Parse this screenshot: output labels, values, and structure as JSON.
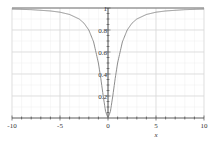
{
  "chart_data": {
    "type": "line",
    "title": "",
    "xlabel": "x",
    "ylabel": "",
    "xlim": [
      -10,
      10
    ],
    "ylim": [
      0,
      1
    ],
    "grid": true,
    "legend": null,
    "x_ticks": [
      -10,
      -5,
      0,
      5,
      10
    ],
    "x_tick_labels": [
      "-10",
      "-5",
      "0",
      "5",
      "10"
    ],
    "y_ticks": [
      0.2,
      0.4,
      0.6,
      0.8,
      1
    ],
    "y_tick_labels": [
      "0.2",
      "0.4",
      "0.6",
      "0.8",
      "1"
    ],
    "series": [
      {
        "name": "f(x)",
        "color": "#808080",
        "x": [
          -10,
          -8,
          -6,
          -5,
          -4,
          -3,
          -2.5,
          -2,
          -1.5,
          -1,
          -0.75,
          -0.5,
          -0.25,
          0,
          0.25,
          0.5,
          0.75,
          1,
          1.5,
          2,
          2.5,
          3,
          4,
          5,
          6,
          8,
          10
        ],
        "values": [
          0.99,
          0.985,
          0.973,
          0.962,
          0.941,
          0.9,
          0.862,
          0.8,
          0.692,
          0.5,
          0.36,
          0.2,
          0.059,
          0,
          0.059,
          0.2,
          0.36,
          0.5,
          0.692,
          0.8,
          0.862,
          0.9,
          0.941,
          0.962,
          0.973,
          0.985,
          0.99
        ]
      }
    ]
  },
  "colors": {
    "background": "#ffffff",
    "curve": "#808080",
    "axis": "#333333",
    "grid_major": "#d9d9d9",
    "grid_minor": "#eeeeee"
  }
}
